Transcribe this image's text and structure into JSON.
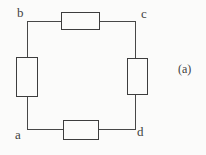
{
  "figure": {
    "label": "(a)",
    "corners": [
      {
        "id": "b",
        "label": "b",
        "position": "top-left"
      },
      {
        "id": "c",
        "label": "c",
        "position": "top-right"
      },
      {
        "id": "a",
        "label": "a",
        "position": "bottom-left"
      },
      {
        "id": "d",
        "label": "d",
        "position": "bottom-right"
      }
    ],
    "components": [
      {
        "name": "resistor-top",
        "between": "b-c"
      },
      {
        "name": "resistor-right",
        "between": "c-d"
      },
      {
        "name": "resistor-bottom",
        "between": "a-d"
      },
      {
        "name": "resistor-left",
        "between": "b-a"
      }
    ]
  },
  "colors": {
    "line": "#474747",
    "component_border": "#3d3d3d",
    "text": "#3f3f3f",
    "background": "#fbfbfa"
  }
}
